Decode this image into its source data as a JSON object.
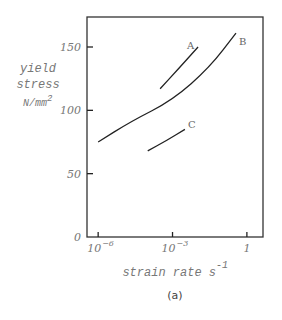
{
  "chart_data": {
    "type": "line",
    "title": "",
    "caption": "(a)",
    "xlabel": "strain rate s",
    "xlabel_superscript": "-1",
    "ylabel_lines": [
      "yield",
      "stress",
      "N/mm"
    ],
    "ylabel_superscript": "2",
    "xscale": "log",
    "xlim_log10": [
      -6.45,
      0.65
    ],
    "ylim": [
      0,
      150
    ],
    "x_ticks": [
      {
        "log10": -6,
        "label": "10",
        "sup": "−6"
      },
      {
        "log10": -3,
        "label": "10",
        "sup": "−3"
      },
      {
        "log10": 0,
        "label": "1",
        "sup": ""
      }
    ],
    "y_ticks": [
      {
        "value": 0,
        "label": "0"
      },
      {
        "value": 50,
        "label": "50"
      },
      {
        "value": 100,
        "label": "100"
      },
      {
        "value": 150,
        "label": "150"
      }
    ],
    "grid": false,
    "series": [
      {
        "name": "A",
        "points": [
          [
            -3.5,
            117
          ],
          [
            -2.75,
            133
          ],
          [
            -1.97,
            150
          ]
        ]
      },
      {
        "name": "B",
        "points": [
          [
            -6.0,
            75
          ],
          [
            -4.7,
            91
          ],
          [
            -3.0,
            108
          ],
          [
            -1.5,
            134
          ],
          [
            -0.44,
            161
          ]
        ]
      },
      {
        "name": "C",
        "points": [
          [
            -4.0,
            68
          ],
          [
            -3.25,
            76
          ],
          [
            -2.5,
            85
          ]
        ]
      }
    ]
  }
}
